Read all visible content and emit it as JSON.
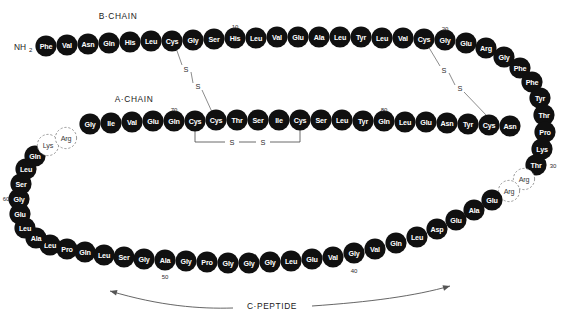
{
  "figure": {
    "background_color": "#ffffff",
    "residue_fill": "#101010",
    "residue_text_color": "#ffffff",
    "dashed_residue_stroke": "#8c8c8c",
    "bond_line_color": "#6e6e6e"
  },
  "labels": {
    "b_chain": "B·CHAIN",
    "a_chain": "A·CHAIN",
    "c_peptide": "C·PEPTIDE",
    "n_terminus": "NH",
    "n_terminus_subscript": "2",
    "sulfur": "S"
  },
  "position_numbers": [
    "10",
    "20",
    "30",
    "40",
    "50",
    "60",
    "70",
    "80"
  ],
  "b_chain": {
    "name": "B·CHAIN",
    "residues": [
      {
        "n": 1,
        "aa": "Phe",
        "x": 46,
        "y": 46,
        "dashed": false
      },
      {
        "n": 2,
        "aa": "Val",
        "x": 67,
        "y": 45,
        "dashed": false
      },
      {
        "n": 3,
        "aa": "Asn",
        "x": 88,
        "y": 44,
        "dashed": false
      },
      {
        "n": 4,
        "aa": "Gln",
        "x": 109,
        "y": 43,
        "dashed": false
      },
      {
        "n": 5,
        "aa": "His",
        "x": 130,
        "y": 42,
        "dashed": false
      },
      {
        "n": 6,
        "aa": "Leu",
        "x": 151,
        "y": 41,
        "dashed": false
      },
      {
        "n": 7,
        "aa": "Cys",
        "x": 172,
        "y": 41,
        "dashed": false
      },
      {
        "n": 8,
        "aa": "Gly",
        "x": 193,
        "y": 40,
        "dashed": false
      },
      {
        "n": 9,
        "aa": "Ser",
        "x": 214,
        "y": 39,
        "dashed": false
      },
      {
        "n": 10,
        "aa": "His",
        "x": 235,
        "y": 38,
        "dashed": false
      },
      {
        "n": 11,
        "aa": "Leu",
        "x": 256,
        "y": 38,
        "dashed": false
      },
      {
        "n": 12,
        "aa": "Val",
        "x": 277,
        "y": 37,
        "dashed": false
      },
      {
        "n": 13,
        "aa": "Glu",
        "x": 298,
        "y": 37,
        "dashed": false
      },
      {
        "n": 14,
        "aa": "Ala",
        "x": 319,
        "y": 37,
        "dashed": false
      },
      {
        "n": 15,
        "aa": "Leu",
        "x": 340,
        "y": 37,
        "dashed": false
      },
      {
        "n": 16,
        "aa": "Tyr",
        "x": 361,
        "y": 37,
        "dashed": false
      },
      {
        "n": 17,
        "aa": "Leu",
        "x": 382,
        "y": 38,
        "dashed": false
      },
      {
        "n": 18,
        "aa": "Val",
        "x": 403,
        "y": 38,
        "dashed": false
      },
      {
        "n": 19,
        "aa": "Cys",
        "x": 424,
        "y": 39,
        "dashed": false
      },
      {
        "n": 20,
        "aa": "Gly",
        "x": 445,
        "y": 40,
        "dashed": false
      },
      {
        "n": 21,
        "aa": "Glu",
        "x": 466,
        "y": 43,
        "dashed": false
      },
      {
        "n": 22,
        "aa": "Arg",
        "x": 486,
        "y": 48,
        "dashed": false
      },
      {
        "n": 23,
        "aa": "Gly",
        "x": 504,
        "y": 57,
        "dashed": false
      },
      {
        "n": 24,
        "aa": "Phe",
        "x": 520,
        "y": 68,
        "dashed": false
      },
      {
        "n": 25,
        "aa": "Phe",
        "x": 532,
        "y": 82,
        "dashed": false
      },
      {
        "n": 26,
        "aa": "Tyr",
        "x": 540,
        "y": 98,
        "dashed": false
      },
      {
        "n": 27,
        "aa": "Thr",
        "x": 544,
        "y": 115,
        "dashed": false
      },
      {
        "n": 28,
        "aa": "Pro",
        "x": 545,
        "y": 132,
        "dashed": false
      },
      {
        "n": 29,
        "aa": "Lys",
        "x": 542,
        "y": 149,
        "dashed": false
      },
      {
        "n": 30,
        "aa": "Thr",
        "x": 536,
        "y": 165,
        "dashed": false
      }
    ]
  },
  "c_peptide": {
    "name": "C·PEPTIDE",
    "residues": [
      {
        "n": 31,
        "aa": "Arg",
        "x": 524,
        "y": 179,
        "dashed": true
      },
      {
        "n": 32,
        "aa": "Arg",
        "x": 509,
        "y": 191,
        "dashed": true
      },
      {
        "n": 33,
        "aa": "Glu",
        "x": 492,
        "y": 200,
        "dashed": false
      },
      {
        "n": 34,
        "aa": "Ala",
        "x": 474,
        "y": 210,
        "dashed": false
      },
      {
        "n": 35,
        "aa": "Glu",
        "x": 456,
        "y": 220,
        "dashed": false
      },
      {
        "n": 36,
        "aa": "Asp",
        "x": 437,
        "y": 229,
        "dashed": false
      },
      {
        "n": 37,
        "aa": "Leu",
        "x": 417,
        "y": 237,
        "dashed": false
      },
      {
        "n": 38,
        "aa": "Gln",
        "x": 396,
        "y": 243,
        "dashed": false
      },
      {
        "n": 39,
        "aa": "Val",
        "x": 375,
        "y": 249,
        "dashed": false
      },
      {
        "n": 40,
        "aa": "Gly",
        "x": 354,
        "y": 253,
        "dashed": false
      },
      {
        "n": 41,
        "aa": "Val",
        "x": 333,
        "y": 257,
        "dashed": false
      },
      {
        "n": 42,
        "aa": "Glu",
        "x": 312,
        "y": 259,
        "dashed": false
      },
      {
        "n": 43,
        "aa": "Leu",
        "x": 291,
        "y": 261,
        "dashed": false
      },
      {
        "n": 44,
        "aa": "Gly",
        "x": 270,
        "y": 262,
        "dashed": false
      },
      {
        "n": 45,
        "aa": "Gly",
        "x": 249,
        "y": 263,
        "dashed": false
      },
      {
        "n": 46,
        "aa": "Gly",
        "x": 228,
        "y": 263,
        "dashed": false
      },
      {
        "n": 47,
        "aa": "Pro",
        "x": 207,
        "y": 262,
        "dashed": false
      },
      {
        "n": 48,
        "aa": "Gly",
        "x": 186,
        "y": 261,
        "dashed": false
      },
      {
        "n": 49,
        "aa": "Ala",
        "x": 165,
        "y": 260,
        "dashed": false
      },
      {
        "n": 50,
        "aa": "Gly",
        "x": 144,
        "y": 259,
        "dashed": false
      },
      {
        "n": 51,
        "aa": "Ser",
        "x": 124,
        "y": 257,
        "dashed": false
      },
      {
        "n": 52,
        "aa": "Leu",
        "x": 104,
        "y": 255,
        "dashed": false
      },
      {
        "n": 53,
        "aa": "Gln",
        "x": 85,
        "y": 252,
        "dashed": false
      },
      {
        "n": 54,
        "aa": "Pro",
        "x": 67,
        "y": 249,
        "dashed": false
      },
      {
        "n": 55,
        "aa": "Leu",
        "x": 50,
        "y": 245,
        "dashed": false
      },
      {
        "n": 56,
        "aa": "Ala",
        "x": 36,
        "y": 238,
        "dashed": false
      },
      {
        "n": 57,
        "aa": "Leu",
        "x": 25,
        "y": 228,
        "dashed": false
      },
      {
        "n": 58,
        "aa": "Glu",
        "x": 20,
        "y": 214,
        "dashed": false
      },
      {
        "n": 59,
        "aa": "Gly",
        "x": 19,
        "y": 199,
        "dashed": false
      },
      {
        "n": 60,
        "aa": "Ser",
        "x": 21,
        "y": 184,
        "dashed": false
      },
      {
        "n": 61,
        "aa": "Leu",
        "x": 26,
        "y": 169,
        "dashed": false
      },
      {
        "n": 62,
        "aa": "Gln",
        "x": 35,
        "y": 156,
        "dashed": false
      },
      {
        "n": 63,
        "aa": "Lys",
        "x": 48,
        "y": 145,
        "dashed": true
      },
      {
        "n": 64,
        "aa": "Arg",
        "x": 66,
        "y": 138,
        "dashed": true
      }
    ]
  },
  "a_chain": {
    "name": "A·CHAIN",
    "residues": [
      {
        "n": 65,
        "aa": "Gly",
        "x": 90,
        "y": 124,
        "dashed": false
      },
      {
        "n": 66,
        "aa": "Ile",
        "x": 111,
        "y": 123,
        "dashed": false
      },
      {
        "n": 67,
        "aa": "Val",
        "x": 132,
        "y": 122,
        "dashed": false
      },
      {
        "n": 68,
        "aa": "Glu",
        "x": 153,
        "y": 121,
        "dashed": false
      },
      {
        "n": 69,
        "aa": "Gln",
        "x": 174,
        "y": 121,
        "dashed": false
      },
      {
        "n": 70,
        "aa": "Cys",
        "x": 195,
        "y": 121,
        "dashed": false
      },
      {
        "n": 71,
        "aa": "Cys",
        "x": 216,
        "y": 120,
        "dashed": false
      },
      {
        "n": 72,
        "aa": "Thr",
        "x": 237,
        "y": 120,
        "dashed": false
      },
      {
        "n": 73,
        "aa": "Ser",
        "x": 258,
        "y": 120,
        "dashed": false
      },
      {
        "n": 74,
        "aa": "Ile",
        "x": 279,
        "y": 120,
        "dashed": false
      },
      {
        "n": 75,
        "aa": "Cys",
        "x": 300,
        "y": 120,
        "dashed": false
      },
      {
        "n": 76,
        "aa": "Ser",
        "x": 321,
        "y": 120,
        "dashed": false
      },
      {
        "n": 77,
        "aa": "Leu",
        "x": 342,
        "y": 120,
        "dashed": false
      },
      {
        "n": 78,
        "aa": "Tyr",
        "x": 363,
        "y": 121,
        "dashed": false
      },
      {
        "n": 79,
        "aa": "Gln",
        "x": 384,
        "y": 121,
        "dashed": false
      },
      {
        "n": 80,
        "aa": "Leu",
        "x": 405,
        "y": 122,
        "dashed": false
      },
      {
        "n": 81,
        "aa": "Glu",
        "x": 426,
        "y": 122,
        "dashed": false
      },
      {
        "n": 82,
        "aa": "Asn",
        "x": 447,
        "y": 123,
        "dashed": false
      },
      {
        "n": 83,
        "aa": "Tyr",
        "x": 468,
        "y": 124,
        "dashed": false
      },
      {
        "n": 84,
        "aa": "Cys",
        "x": 489,
        "y": 125,
        "dashed": false
      },
      {
        "n": 85,
        "aa": "Asn",
        "x": 510,
        "y": 126,
        "dashed": false
      }
    ]
  },
  "number_markers": [
    {
      "text": "10",
      "x": 235,
      "y": 27
    },
    {
      "text": "20",
      "x": 445,
      "y": 29
    },
    {
      "text": "30",
      "x": 553,
      "y": 166
    },
    {
      "text": "40",
      "x": 354,
      "y": 271
    },
    {
      "text": "50",
      "x": 165,
      "y": 277
    },
    {
      "text": "60",
      "x": 6,
      "y": 199
    },
    {
      "text": "70",
      "x": 174,
      "y": 110
    },
    {
      "text": "80",
      "x": 384,
      "y": 110
    }
  ],
  "disulfide_bonds": [
    {
      "id": "B7-A71",
      "label_a": "S",
      "label_b": "S",
      "from_x": 176,
      "from_y": 48,
      "to_x": 212,
      "to_y": 112,
      "s1_x": 186,
      "s1_y": 69,
      "s2_x": 198,
      "s2_y": 86
    },
    {
      "id": "B19-A84",
      "label_a": "S",
      "label_b": "S",
      "from_x": 428,
      "from_y": 46,
      "to_x": 487,
      "to_y": 116,
      "s1_x": 444,
      "s1_y": 70,
      "s2_x": 460,
      "s2_y": 88
    },
    {
      "id": "A70-A75",
      "label_a": "S",
      "label_b": "S",
      "bracket_left_x": 195,
      "bracket_right_x": 300,
      "bracket_top_y": 129,
      "bracket_bottom_y": 142,
      "s1_x": 232,
      "s1_y": 142,
      "s2_x": 263,
      "s2_y": 142
    }
  ],
  "chain_label_positions": {
    "b_chain": {
      "x": 118,
      "y": 16
    },
    "a_chain": {
      "x": 134,
      "y": 99
    },
    "c_peptide": {
      "x": 272,
      "y": 306
    },
    "n_terminus": {
      "x": 20,
      "y": 47
    }
  },
  "c_peptide_arrow": {
    "path": "M 110 291 C 200 312, 360 312, 450 286",
    "left_arrow_tip": {
      "x": 110,
      "y": 291
    },
    "right_arrow_tip": {
      "x": 450,
      "y": 286
    }
  }
}
